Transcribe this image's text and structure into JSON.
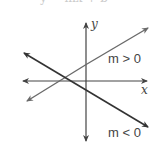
{
  "diagram": {
    "title_partial": "y = mx + b",
    "axes": {
      "x_label": "x",
      "y_label": "y"
    },
    "lines": [
      {
        "name": "positive-slope-line",
        "label": "m > 0",
        "color": "#6a6a6a"
      },
      {
        "name": "negative-slope-line",
        "label": "m < 0",
        "color": "#333333"
      }
    ],
    "colors": {
      "axis": "#444444",
      "positive": "#6a6a6a",
      "negative": "#333333"
    }
  }
}
